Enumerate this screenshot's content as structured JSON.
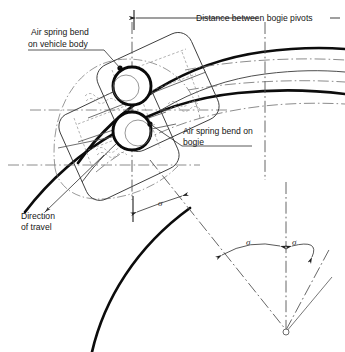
{
  "figure": {
    "background_color": "#ffffff",
    "ink_color": "#0c0c0c",
    "labels": {
      "air_spring_body_line1": "Air spring bend",
      "air_spring_body_line2": "on vehicle body",
      "distance_between_pivots": "Distance between bogie pivots",
      "air_spring_bogie_line1": "Air spring bend on",
      "air_spring_bogie_line2": "bogie",
      "direction_line1": "Direction",
      "direction_line2": "of travel",
      "angle_symbol_upper": "σ",
      "angle_symbol_lower_left": "σ",
      "angle_symbol_lower_right": "σ"
    },
    "annotations": [
      {
        "name": "air-spring-vehicle-body",
        "text": "Air spring bend on vehicle body",
        "target": "upper pivot circle"
      },
      {
        "name": "air-spring-bogie",
        "text": "Air spring bend on bogie",
        "target": "lower pivot circle"
      },
      {
        "name": "distance-between-bogie-pivots",
        "text": "Distance between bogie pivots",
        "target": "horizontal dimension between pivot verticals"
      },
      {
        "name": "direction-of-travel",
        "text": "Direction of travel",
        "target": "arrow along the track toward lower left"
      }
    ],
    "angles": [
      {
        "name": "upper-sigma",
        "symbol": "σ",
        "location": "between vertical pivot axis and radial line"
      },
      {
        "name": "lower-left-sigma",
        "symbol": "σ",
        "location": "left of vertical radius at centre of curvature"
      },
      {
        "name": "lower-right-sigma",
        "symbol": "σ",
        "location": "right of vertical radius at centre of curvature"
      }
    ],
    "elements": {
      "pivot_circles": 2,
      "rail_arcs": 2,
      "track_centre_arc": 1,
      "centre_of_curvature": "bottom, where radial lines converge"
    }
  }
}
